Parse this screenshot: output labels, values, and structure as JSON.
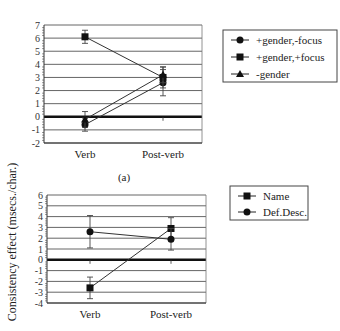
{
  "figure": {
    "ylabel": "Consistency effect (msecs./char.)",
    "panel_a_caption": "(a)"
  },
  "chart_data": [
    {
      "type": "line",
      "panel": "(a)",
      "categories": [
        "Verb",
        "Post-verb"
      ],
      "ylim": [
        -2,
        7
      ],
      "yticks": [
        7,
        6,
        5,
        4,
        3,
        2,
        1,
        0,
        -1,
        -2
      ],
      "grid": true,
      "legend_position": "right",
      "series": [
        {
          "name": "+gender,-focus",
          "marker": "circle",
          "values": [
            -0.6,
            2.6
          ],
          "error": [
            0.5,
            1.0
          ]
        },
        {
          "name": "+gender,+focus",
          "marker": "square",
          "values": [
            6.1,
            3.0
          ],
          "error": [
            0.5,
            0.8
          ]
        },
        {
          "name": "-gender",
          "marker": "triangle",
          "values": [
            -0.2,
            3.2
          ],
          "error": [
            0.6,
            0.6
          ]
        }
      ]
    },
    {
      "type": "line",
      "panel": "(b)",
      "categories": [
        "Verb",
        "Post-verb"
      ],
      "ylim": [
        -4,
        6
      ],
      "yticks": [
        6,
        5,
        4,
        3,
        2,
        1,
        0,
        -1,
        -2,
        -3,
        -4
      ],
      "grid": true,
      "legend_position": "right",
      "series": [
        {
          "name": "Name",
          "marker": "square",
          "values": [
            -2.6,
            2.9
          ],
          "error": [
            1.0,
            1.0
          ]
        },
        {
          "name": "Def.Desc.",
          "marker": "circle",
          "values": [
            2.6,
            1.9
          ],
          "error": [
            1.5,
            1.0
          ]
        }
      ]
    }
  ]
}
